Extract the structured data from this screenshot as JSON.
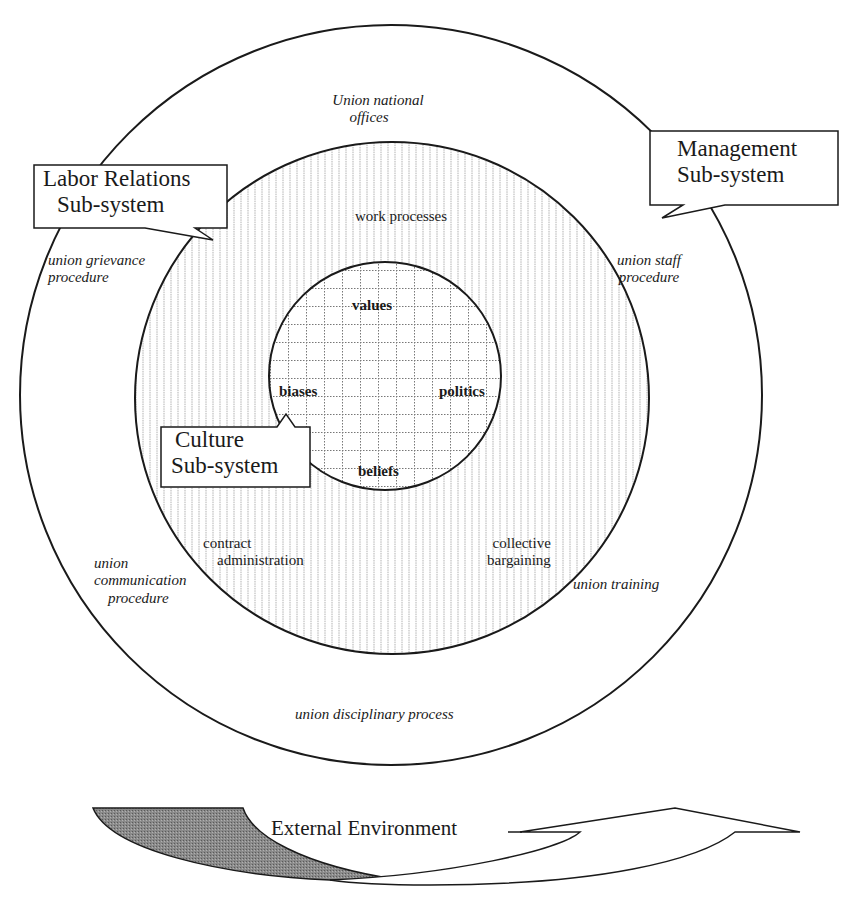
{
  "diagram": {
    "colors": {
      "line": "#1a1a1a",
      "background": "#ffffff",
      "hatch": "#9a9a9a",
      "arrow_shade": "#7a7a7a"
    },
    "outer_ring": {
      "labels": {
        "top": [
          "Union national",
          "offices"
        ],
        "upper_left": [
          "union  grievance",
          "procedure"
        ],
        "upper_right": [
          "union staff",
          "procedure"
        ],
        "lower_left": [
          "union",
          "communication",
          "procedure"
        ],
        "lower_right": "union training",
        "bottom": "union disciplinary process"
      }
    },
    "middle_ring": {
      "labels": {
        "top": "work  processes",
        "lower_left": [
          "contract",
          "administration"
        ],
        "lower_right": [
          "collective",
          "bargaining"
        ]
      }
    },
    "inner_circle": {
      "labels": {
        "top": "values",
        "left": "biases",
        "right": "politics",
        "bottom": "beliefs"
      }
    },
    "callouts": {
      "labor_relations": [
        "Labor Relations",
        "Sub-system"
      ],
      "management": [
        "Management",
        "Sub-system"
      ],
      "culture": [
        "Culture",
        "Sub-system"
      ]
    },
    "external": {
      "label": "External Environment"
    }
  }
}
